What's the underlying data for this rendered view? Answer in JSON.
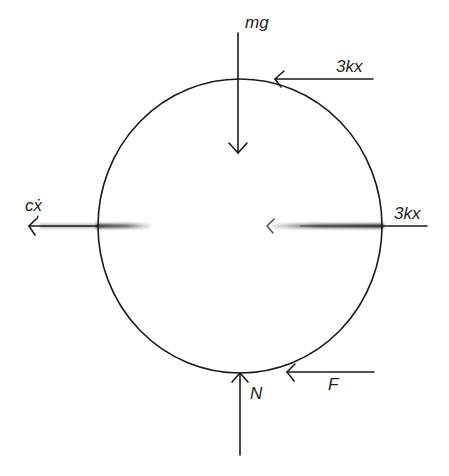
{
  "diagram": {
    "type": "free-body-diagram",
    "body": {
      "shape": "circle",
      "cx": 240,
      "cy": 226,
      "rx": 142,
      "ry": 147
    },
    "forces": {
      "weight": {
        "label": "mg",
        "direction": "down"
      },
      "spring_top": {
        "label": "3kx",
        "direction": "left"
      },
      "spring_center": {
        "label": "3kx",
        "direction": "left"
      },
      "damping": {
        "label": "cẋ",
        "direction": "left"
      },
      "normal": {
        "label": "N",
        "direction": "up"
      },
      "friction": {
        "label": "F",
        "direction": "left"
      }
    }
  }
}
